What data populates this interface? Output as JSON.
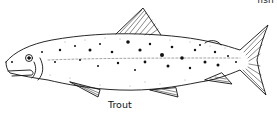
{
  "figure": {
    "corner_text": "fish",
    "caption": "Trout",
    "style": "black-and-white line drawing with stippled spots",
    "colors": {
      "ink": "#111111",
      "background": "#ffffff"
    }
  }
}
